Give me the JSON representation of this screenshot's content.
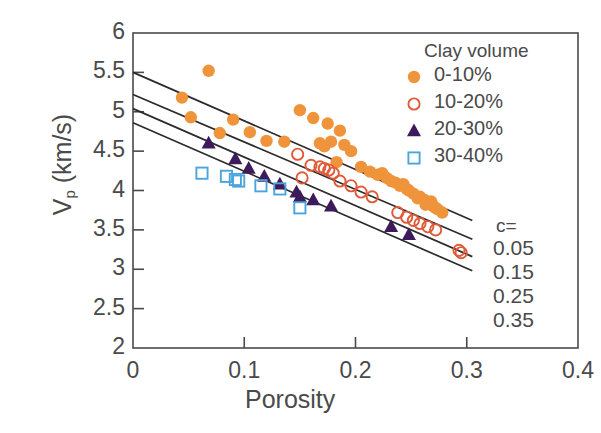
{
  "chart_data": {
    "type": "scatter",
    "title": "",
    "xlabel": "Porosity",
    "ylabel_main": "V",
    "ylabel_sub": "p",
    "ylabel_unit": " (km/s)",
    "xlim": [
      0,
      0.4
    ],
    "ylim": [
      2,
      6
    ],
    "xticks": [
      "0",
      "0.1",
      "0.2",
      "0.3",
      "0.4"
    ],
    "xtick_values": [
      0,
      0.1,
      0.2,
      0.3,
      0.4
    ],
    "yticks": [
      "2",
      "2.5",
      "3",
      "3.5",
      "4",
      "4.5",
      "5",
      "5.5",
      "6"
    ],
    "ytick_values": [
      2,
      2.5,
      3,
      3.5,
      4,
      4.5,
      5,
      5.5,
      6
    ],
    "grid": false,
    "legend_position": "top-right",
    "legend_title": "Clay volume",
    "series": [
      {
        "name": "0-10%",
        "marker": "filled-circle",
        "color": "#F0943C",
        "points": [
          [
            0.068,
            5.52
          ],
          [
            0.044,
            5.18
          ],
          [
            0.052,
            4.93
          ],
          [
            0.09,
            4.9
          ],
          [
            0.078,
            4.73
          ],
          [
            0.105,
            4.74
          ],
          [
            0.12,
            4.63
          ],
          [
            0.136,
            4.62
          ],
          [
            0.15,
            5.02
          ],
          [
            0.162,
            4.92
          ],
          [
            0.175,
            4.85
          ],
          [
            0.186,
            4.76
          ],
          [
            0.168,
            4.6
          ],
          [
            0.172,
            4.56
          ],
          [
            0.178,
            4.62
          ],
          [
            0.19,
            4.58
          ],
          [
            0.196,
            4.5
          ],
          [
            0.183,
            4.36
          ],
          [
            0.205,
            4.3
          ],
          [
            0.213,
            4.24
          ],
          [
            0.22,
            4.2
          ],
          [
            0.228,
            4.16
          ],
          [
            0.224,
            4.22
          ],
          [
            0.232,
            4.12
          ],
          [
            0.24,
            4.06
          ],
          [
            0.236,
            4.1
          ],
          [
            0.248,
            4.0
          ],
          [
            0.252,
            3.96
          ],
          [
            0.258,
            3.92
          ],
          [
            0.262,
            3.88
          ],
          [
            0.256,
            3.9
          ],
          [
            0.266,
            3.84
          ],
          [
            0.27,
            3.8
          ],
          [
            0.274,
            3.76
          ],
          [
            0.268,
            3.86
          ],
          [
            0.278,
            3.72
          ],
          [
            0.263,
            3.82
          ],
          [
            0.272,
            3.78
          ],
          [
            0.246,
            4.02
          ],
          [
            0.243,
            4.08
          ]
        ]
      },
      {
        "name": "10-20%",
        "marker": "open-circle",
        "color": "#E05A3A",
        "points": [
          [
            0.148,
            4.46
          ],
          [
            0.16,
            4.32
          ],
          [
            0.168,
            4.3
          ],
          [
            0.172,
            4.28
          ],
          [
            0.176,
            4.26
          ],
          [
            0.18,
            4.22
          ],
          [
            0.152,
            4.16
          ],
          [
            0.186,
            4.12
          ],
          [
            0.196,
            4.06
          ],
          [
            0.205,
            3.98
          ],
          [
            0.215,
            3.92
          ],
          [
            0.238,
            3.72
          ],
          [
            0.246,
            3.66
          ],
          [
            0.252,
            3.62
          ],
          [
            0.258,
            3.58
          ],
          [
            0.265,
            3.54
          ],
          [
            0.272,
            3.5
          ],
          [
            0.295,
            3.21
          ],
          [
            0.293,
            3.24
          ]
        ]
      },
      {
        "name": "20-30%",
        "marker": "filled-triangle",
        "color": "#3D1A5B",
        "points": [
          [
            0.068,
            4.6
          ],
          [
            0.092,
            4.4
          ],
          [
            0.104,
            4.28
          ],
          [
            0.118,
            4.18
          ],
          [
            0.132,
            4.08
          ],
          [
            0.147,
            3.98
          ],
          [
            0.15,
            3.92
          ],
          [
            0.162,
            3.88
          ],
          [
            0.178,
            3.8
          ],
          [
            0.232,
            3.54
          ],
          [
            0.248,
            3.44
          ]
        ]
      },
      {
        "name": "30-40%",
        "marker": "open-square",
        "color": "#4BA5DC",
        "points": [
          [
            0.062,
            4.22
          ],
          [
            0.084,
            4.18
          ],
          [
            0.092,
            4.14
          ],
          [
            0.095,
            4.12
          ],
          [
            0.115,
            4.06
          ],
          [
            0.132,
            4.02
          ],
          [
            0.15,
            3.78
          ]
        ]
      }
    ],
    "trend_lines": [
      {
        "label": "0.05",
        "x0": 0.0,
        "y0": 5.5,
        "x1": 0.305,
        "y1": 3.62
      },
      {
        "label": "0.15",
        "x0": 0.0,
        "y0": 5.22,
        "x1": 0.305,
        "y1": 3.38
      },
      {
        "label": "0.25",
        "x0": 0.0,
        "y0": 5.04,
        "x1": 0.305,
        "y1": 3.16
      },
      {
        "label": "0.35",
        "x0": 0.0,
        "y0": 4.86,
        "x1": 0.305,
        "y1": 2.98
      }
    ],
    "trend_label_header": "c=",
    "trend_labels": [
      "0.05",
      "0.15",
      "0.25",
      "0.35"
    ],
    "axis_color": "#4a4a4a",
    "line_color": "#2b2b2b"
  }
}
